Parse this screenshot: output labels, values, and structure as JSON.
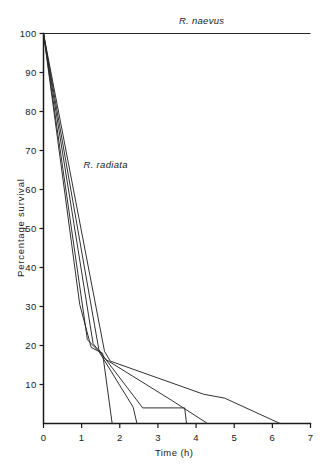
{
  "chart_data": {
    "type": "line",
    "title": "",
    "xlabel": "Time (h)",
    "ylabel": "Percentage survival",
    "xlim": [
      0,
      7
    ],
    "ylim": [
      0,
      100
    ],
    "xticks": [
      0,
      1,
      2,
      3,
      4,
      5,
      6,
      7
    ],
    "xtick_labels": [
      "0",
      "1",
      "2",
      "3",
      "4",
      "5",
      "6",
      "7"
    ],
    "yticks": [
      10,
      20,
      30,
      40,
      50,
      60,
      70,
      80,
      90,
      100
    ],
    "ytick_labels": [
      "10",
      "20",
      "30",
      "40",
      "50",
      "60",
      "70",
      "80",
      "90",
      "100"
    ],
    "grid": false,
    "legend_position": "inline-annotation",
    "annotations": [
      {
        "text": "R. naevus",
        "x": 3.55,
        "y": 103,
        "style": "italic"
      },
      {
        "text": "R. radiata",
        "x": 1.05,
        "y": 66,
        "style": "italic"
      }
    ],
    "series": [
      {
        "name": "R. naevus",
        "points": [
          [
            0,
            100
          ],
          [
            7,
            100
          ]
        ]
      },
      {
        "name": "R. radiata replicate 1",
        "points": [
          [
            0,
            100
          ],
          [
            0.95,
            30.5
          ],
          [
            1.25,
            19.5
          ],
          [
            1.55,
            18.0
          ],
          [
            1.8,
            0
          ]
        ]
      },
      {
        "name": "R. radiata replicate 2",
        "points": [
          [
            0,
            100
          ],
          [
            1.15,
            21.5
          ],
          [
            1.45,
            18.5
          ],
          [
            2.35,
            4.2
          ],
          [
            2.45,
            0
          ]
        ]
      },
      {
        "name": "R. radiata replicate 3",
        "points": [
          [
            0,
            100
          ],
          [
            1.3,
            20.5
          ],
          [
            1.55,
            17.5
          ],
          [
            2.6,
            4.0
          ],
          [
            3.7,
            4.0
          ],
          [
            3.75,
            0
          ]
        ]
      },
      {
        "name": "R. radiata replicate 4",
        "points": [
          [
            0,
            100
          ],
          [
            1.45,
            19.0
          ],
          [
            1.62,
            16.5
          ],
          [
            3.35,
            6.0
          ],
          [
            4.3,
            0
          ]
        ]
      },
      {
        "name": "R. radiata replicate 5",
        "points": [
          [
            0,
            100
          ],
          [
            1.6,
            18.5
          ],
          [
            1.75,
            16.0
          ],
          [
            4.2,
            7.5
          ],
          [
            4.75,
            6.5
          ],
          [
            6.2,
            0
          ]
        ]
      }
    ]
  },
  "figure": {
    "background_color": "#ffffff",
    "line_color": "#262626",
    "axis_color": "#1a1a1a"
  }
}
